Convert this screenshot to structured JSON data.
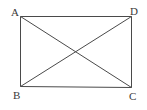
{
  "diagram": {
    "type": "rectangle-with-diagonals",
    "vertices": [
      {
        "id": "A",
        "label": "A",
        "x": 20,
        "y": 16,
        "label_x": 11,
        "label_y": 16
      },
      {
        "id": "D",
        "label": "D",
        "x": 131,
        "y": 16,
        "label_x": 130,
        "label_y": 15
      },
      {
        "id": "B",
        "label": "B",
        "x": 20,
        "y": 86,
        "label_x": 13,
        "label_y": 99
      },
      {
        "id": "C",
        "label": "C",
        "x": 131,
        "y": 87,
        "label_x": 129,
        "label_y": 100
      }
    ],
    "edges": [
      {
        "from": "A",
        "to": "D",
        "kind": "side"
      },
      {
        "from": "D",
        "to": "C",
        "kind": "side"
      },
      {
        "from": "C",
        "to": "B",
        "kind": "side"
      },
      {
        "from": "B",
        "to": "A",
        "kind": "side"
      },
      {
        "from": "A",
        "to": "C",
        "kind": "diagonal"
      },
      {
        "from": "B",
        "to": "D",
        "kind": "diagonal"
      }
    ],
    "colors": {
      "line": "#4a4a4a",
      "label": "#3a3a3a",
      "background": "#ffffff"
    }
  }
}
